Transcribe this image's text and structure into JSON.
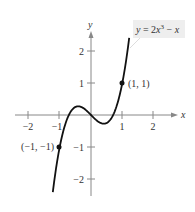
{
  "chart_data": {
    "type": "line",
    "title": "",
    "function_label": "y = 2x³ − x",
    "function_label_parts": {
      "prefix": "y",
      "eq": " = 2",
      "var": "x",
      "exp": "3",
      "rest": " − ",
      "var2": "x"
    },
    "xlabel": "x",
    "ylabel": "y",
    "xlim": [
      -2.5,
      2.6
    ],
    "ylim": [
      -2.5,
      2.6
    ],
    "x_ticks": [
      -2,
      -1,
      1,
      2
    ],
    "x_tick_labels": [
      "−2",
      "−1",
      "1",
      "2"
    ],
    "y_ticks": [
      2,
      1,
      -1,
      -2
    ],
    "y_tick_labels": [
      "2",
      "1",
      "−1",
      "−2"
    ],
    "grid": false,
    "series": [
      {
        "name": "y = 2x^3 - x",
        "x": [
          -1.22,
          -1.0,
          -0.8,
          -0.6,
          -0.41,
          -0.2,
          0.0,
          0.2,
          0.41,
          0.6,
          0.8,
          1.0,
          1.22
        ],
        "values": [
          -2.41,
          -1.0,
          -0.22,
          0.17,
          0.27,
          0.18,
          0.0,
          -0.18,
          -0.27,
          -0.17,
          0.22,
          1.0,
          2.41
        ]
      }
    ],
    "points": [
      {
        "x": 1,
        "y": 1,
        "label": "(1, 1)"
      },
      {
        "x": -1,
        "y": -1,
        "label": "(−1, −1)"
      }
    ]
  }
}
